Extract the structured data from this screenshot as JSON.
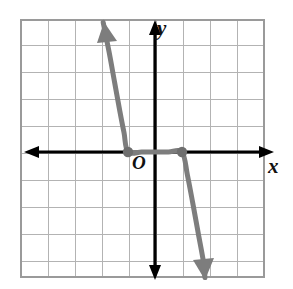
{
  "figure": {
    "kind": "coordinate-plane-graph",
    "width": 293,
    "height": 289,
    "background_color": "#ffffff"
  },
  "labels": {
    "x_axis": "x",
    "y_axis": "y",
    "origin": "O"
  },
  "colors": {
    "grid_line": "#b3b3b3",
    "grid_border": "#9a9a9a",
    "axis": "#000000",
    "curve": "#7d7d7d",
    "point": "#6e6e6e",
    "label": "#111111"
  },
  "chart_data": {
    "type": "line",
    "title": "",
    "xlabel": "x",
    "ylabel": "y",
    "grid": true,
    "legend": false,
    "xlim": [
      -5,
      4
    ],
    "ylim": [
      -4.6,
      4.9
    ],
    "x_tick_step": 1,
    "y_tick_step": 1,
    "tick_labels_shown": false,
    "origin_label": "O",
    "curve": {
      "name": "decreasing cubic",
      "color": "#7d7d7d",
      "stroke_width": 5,
      "direction": "decreasing",
      "arrow_start": "up-left",
      "arrow_end": "down-right",
      "x_intercepts": [
        -1,
        1
      ],
      "points": [
        {
          "x": -1.92,
          "y": 4.8
        },
        {
          "x": -1.7,
          "y": 3.7
        },
        {
          "x": -1.5,
          "y": 2.6
        },
        {
          "x": -1.3,
          "y": 1.5
        },
        {
          "x": -1.15,
          "y": 0.72
        },
        {
          "x": -1.0,
          "y": 0.0
        },
        {
          "x": -0.5,
          "y": 0.0
        },
        {
          "x": 0.0,
          "y": 0.0
        },
        {
          "x": 0.5,
          "y": 0.0
        },
        {
          "x": 1.0,
          "y": 0.0
        },
        {
          "x": 1.2,
          "y": -0.85
        },
        {
          "x": 1.4,
          "y": -1.9
        },
        {
          "x": 1.6,
          "y": -3.0
        },
        {
          "x": 1.8,
          "y": -4.1
        },
        {
          "x": 1.85,
          "y": -4.65
        }
      ]
    },
    "marked_points": [
      {
        "x": -1,
        "y": 0,
        "label": ""
      },
      {
        "x": 1,
        "y": 0,
        "label": ""
      }
    ],
    "axes": {
      "x_axis_arrows": [
        "left",
        "right"
      ],
      "y_axis_arrows": [
        "up",
        "down"
      ]
    }
  }
}
